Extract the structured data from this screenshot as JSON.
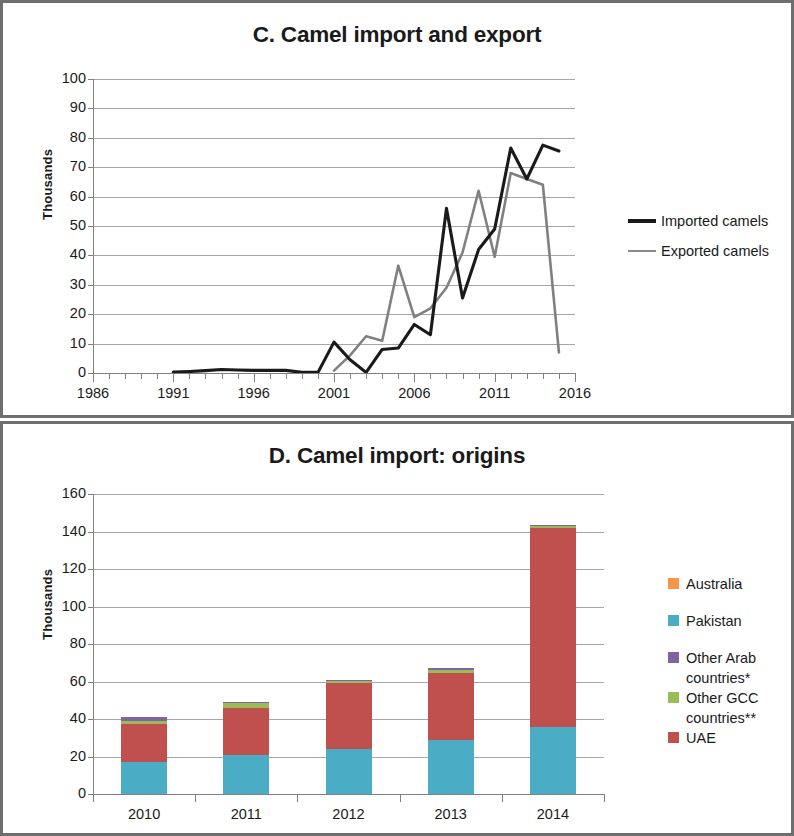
{
  "chart_data": [
    {
      "type": "line",
      "panel": "C",
      "title": "C. Camel import and export",
      "xlabel": "",
      "ylabel": "Thousands",
      "xlim": [
        1986,
        2016
      ],
      "ylim": [
        0,
        100
      ],
      "ytick_labels": [
        "100",
        "90",
        "80",
        "70",
        "60",
        "50",
        "40",
        "30",
        "20",
        "10",
        "0"
      ],
      "ytick_values": [
        100,
        90,
        80,
        70,
        60,
        50,
        40,
        30,
        20,
        10,
        0
      ],
      "xtick_labels": [
        "1986",
        "1991",
        "1996",
        "2001",
        "2006",
        "2011",
        "2016"
      ],
      "xtick_values": [
        1986,
        1991,
        1996,
        2001,
        2006,
        2011,
        2016
      ],
      "grid": "horizontal",
      "legend_position": "right",
      "colors": {
        "imported": "#1a1a1a",
        "exported": "#808080"
      },
      "series": [
        {
          "name": "Imported camels",
          "color": "#1a1a1a",
          "x": [
            1991,
            1992,
            1993,
            1994,
            1995,
            1996,
            1997,
            1998,
            1999,
            2000,
            2001,
            2002,
            2003,
            2004,
            2005,
            2006,
            2007,
            2008,
            2009,
            2010,
            2011,
            2012,
            2013,
            2014
          ],
          "values": [
            0.3,
            0.5,
            0.8,
            1.2,
            1.0,
            0.9,
            0.9,
            0.9,
            0.2,
            0.2,
            10.5,
            4.5,
            0.2,
            8.0,
            8.5,
            16.5,
            13.0,
            56.0,
            25.5,
            42.0,
            49.0,
            76.5,
            66.0,
            77.5
          ],
          "last_point": {
            "x": 2015,
            "value": 75.5
          }
        },
        {
          "name": "Exported camels",
          "color": "#808080",
          "x": [
            2001,
            2002,
            2003,
            2004,
            2005,
            2006,
            2007,
            2008,
            2009,
            2010,
            2011,
            2012,
            2013,
            2014,
            2015
          ],
          "values": [
            0.8,
            6.0,
            12.5,
            11.0,
            36.5,
            19.0,
            22.0,
            29.0,
            41.0,
            62.0,
            39.5,
            68.0,
            66.0,
            64.0,
            7.0
          ]
        }
      ]
    },
    {
      "type": "bar",
      "panel": "D",
      "stacked": true,
      "title": "D. Camel import: origins",
      "xlabel": "",
      "ylabel": "Thousands",
      "ylim": [
        0,
        160
      ],
      "ytick_labels": [
        "160",
        "140",
        "120",
        "100",
        "80",
        "60",
        "40",
        "20",
        "0"
      ],
      "ytick_values": [
        160,
        140,
        120,
        100,
        80,
        60,
        40,
        20,
        0
      ],
      "categories": [
        "2010",
        "2011",
        "2012",
        "2013",
        "2014"
      ],
      "grid": "horizontal",
      "legend_position": "right",
      "series": [
        {
          "name": "Australia",
          "color": "#F79646",
          "values": [
            0,
            0,
            0,
            0,
            0
          ]
        },
        {
          "name": "Pakistan",
          "color": "#4BACC6",
          "values": [
            17.0,
            21.0,
            24.0,
            29.0,
            36.0
          ]
        },
        {
          "name": "Other Arab countries*",
          "color": "#8064A2",
          "values": [
            2.0,
            0.3,
            0.3,
            1.0,
            0.3
          ]
        },
        {
          "name": "Other GCC countries**",
          "color": "#9BBB59",
          "values": [
            1.5,
            3.0,
            1.5,
            1.5,
            1.0
          ]
        },
        {
          "name": "UAE",
          "color": "#C0504D",
          "values": [
            20.5,
            25.0,
            35.0,
            35.5,
            106.0
          ]
        }
      ],
      "stack_order_bottom_to_top": [
        "Pakistan",
        "UAE",
        "Other GCC countries**",
        "Other Arab countries*"
      ],
      "bar_totals": [
        41.0,
        49.3,
        60.8,
        67.0,
        143.3
      ]
    }
  ],
  "panel_c": {
    "title": "C. Camel import and export",
    "ylabel": "Thousands",
    "yticks": [
      "100",
      "90",
      "80",
      "70",
      "60",
      "50",
      "40",
      "30",
      "20",
      "10",
      "0"
    ],
    "xticks": [
      "1986",
      "1991",
      "1996",
      "2001",
      "2006",
      "2011",
      "2016"
    ],
    "legend": [
      {
        "label": "Imported camels",
        "color": "#1a1a1a",
        "marker": "line-dark"
      },
      {
        "label": "Exported camels",
        "color": "#808080",
        "marker": "line-gray"
      }
    ]
  },
  "panel_d": {
    "title": "D. Camel import: origins",
    "ylabel": "Thousands",
    "yticks": [
      "160",
      "140",
      "120",
      "100",
      "80",
      "60",
      "40",
      "20",
      "0"
    ],
    "xticks": [
      "2010",
      "2011",
      "2012",
      "2013",
      "2014"
    ],
    "legend": [
      {
        "label": "Australia",
        "color": "#F79646"
      },
      {
        "label": "Pakistan",
        "color": "#4BACC6"
      },
      {
        "label": "Other Arab",
        "label2": "countries*",
        "color": "#8064A2"
      },
      {
        "label": "Other GCC",
        "label2": "countries**",
        "color": "#9BBB59"
      },
      {
        "label": "UAE",
        "color": "#C0504D"
      }
    ]
  }
}
